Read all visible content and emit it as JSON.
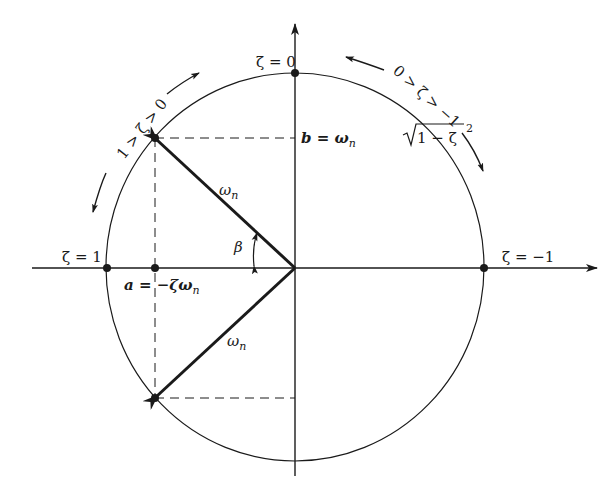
{
  "diagram": {
    "title": "",
    "colors": {
      "ink": "#1a1a1a",
      "background": "#ffffff"
    },
    "labels": {
      "zeta_zero": "ζ = 0",
      "zeta_one": "ζ = 1",
      "zeta_minus_one": "ζ = −1",
      "range_underdamped": "1 > ζ > 0",
      "range_negative": "0 > ζ > −1",
      "b_prefix": "b = ω",
      "b_sub": "n",
      "b_sqrt": "1 − ζ",
      "b_sup": "2",
      "a_prefix": "a = −ζω",
      "a_sub": "n",
      "omega_upper": "ω",
      "omega_upper_sub": "n",
      "omega_lower": "ω",
      "omega_lower_sub": "n",
      "beta": "β"
    },
    "points": [
      {
        "name": "zeta-zero-point",
        "label": "ζ = 0"
      },
      {
        "name": "zeta-one-point",
        "label": "ζ = 1"
      },
      {
        "name": "zeta-minus-one-point",
        "label": "ζ = −1"
      },
      {
        "name": "upper-pole",
        "label": ""
      },
      {
        "name": "lower-pole",
        "label": ""
      },
      {
        "name": "a-point",
        "label": "a = −ζωn"
      }
    ]
  }
}
